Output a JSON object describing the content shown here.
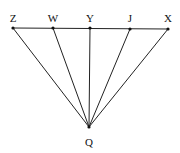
{
  "diagram": {
    "type": "geometry",
    "points": [
      {
        "name": "Z",
        "x": 13,
        "y": 28,
        "label_x": 13,
        "label_y": 22
      },
      {
        "name": "W",
        "x": 53,
        "y": 28,
        "label_x": 53,
        "label_y": 22
      },
      {
        "name": "Y",
        "x": 90,
        "y": 28,
        "label_x": 90,
        "label_y": 22
      },
      {
        "name": "J",
        "x": 130,
        "y": 29,
        "label_x": 130,
        "label_y": 22
      },
      {
        "name": "X",
        "x": 168,
        "y": 29,
        "label_x": 168,
        "label_y": 22
      },
      {
        "name": "Q",
        "x": 89,
        "y": 127,
        "label_x": 89,
        "label_y": 146
      }
    ],
    "segments": [
      [
        "Z",
        "X"
      ],
      [
        "Z",
        "Q"
      ],
      [
        "W",
        "Q"
      ],
      [
        "Y",
        "Q"
      ],
      [
        "J",
        "Q"
      ],
      [
        "X",
        "Q"
      ]
    ],
    "labels": {
      "Z": "Z",
      "W": "W",
      "Y": "Y",
      "J": "J",
      "X": "X",
      "Q": "Q"
    }
  }
}
